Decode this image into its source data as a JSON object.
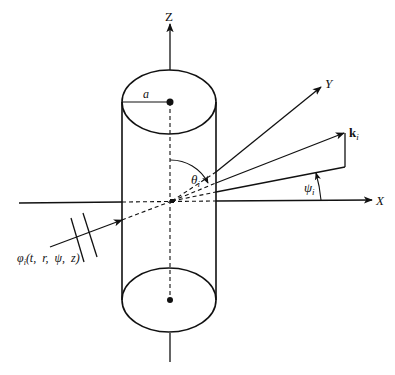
{
  "diagram": {
    "axes": {
      "z_label": "Z",
      "x_label": "X",
      "y_label": "Y"
    },
    "cylinder": {
      "radius_label": "a"
    },
    "angles": {
      "theta_base": "θ",
      "theta_sub": "i",
      "psi_base": "ψ",
      "psi_sub": "i"
    },
    "wave_vector": {
      "base": "k",
      "sub": "i"
    },
    "incident_wave": {
      "base": "φ",
      "sub": "i",
      "args": "(t,  r,  ψ,  z)"
    },
    "colors": {
      "stroke": "#111111",
      "background": "#ffffff"
    }
  }
}
